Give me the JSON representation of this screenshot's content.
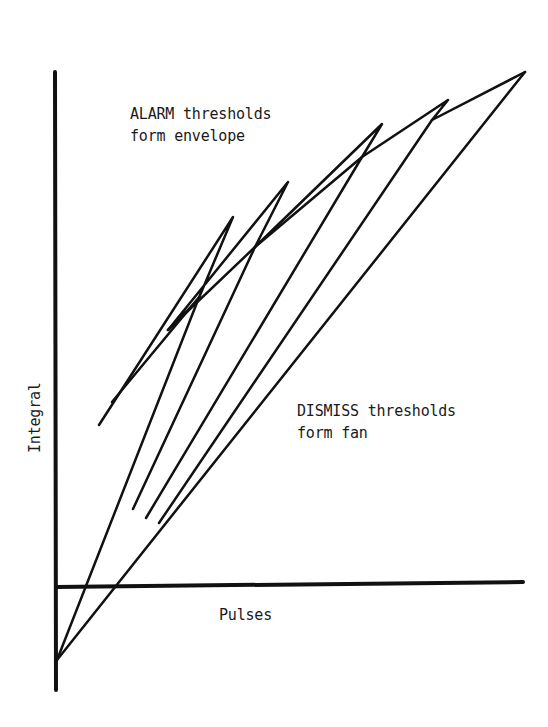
{
  "diagram": {
    "ink_color": "#111111",
    "labels": {
      "alarm_line1": "ALARM thresholds",
      "alarm_line2": "form envelope",
      "dismiss_line1": "DISMISS thresholds",
      "dismiss_line2": "form fan",
      "x_axis": "Pulses",
      "y_axis": "Integral"
    }
  }
}
